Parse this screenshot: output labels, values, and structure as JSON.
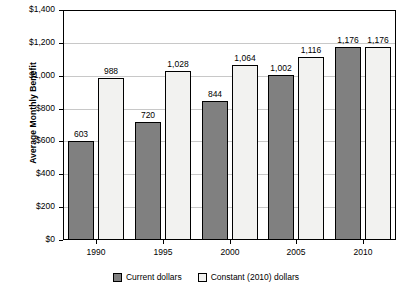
{
  "chart_data": {
    "type": "bar",
    "title": "",
    "xlabel": "",
    "ylabel": "Average Monthly Benefit",
    "categories": [
      "1990",
      "1995",
      "2000",
      "2005",
      "2010"
    ],
    "series": [
      {
        "name": "Current dollars",
        "values": [
          603,
          720,
          844,
          1002,
          1176
        ],
        "labels": [
          "603",
          "720",
          "844",
          "1,002",
          "1,176"
        ],
        "color": "#808080"
      },
      {
        "name": "Constant (2010) dollars",
        "values": [
          988,
          1028,
          1064,
          1116,
          1176
        ],
        "labels": [
          "988",
          "1,028",
          "1,064",
          "1,116",
          "1,176"
        ],
        "color": "#F2F2F0"
      }
    ],
    "ylim": [
      0,
      1400
    ],
    "ytick_values": [
      0,
      200,
      400,
      600,
      800,
      1000,
      1200,
      1400
    ],
    "ytick_labels": [
      "$0",
      "$200",
      "$400",
      "$600",
      "$800",
      "$1,000",
      "$1,200",
      "$1,400"
    ],
    "grid": true,
    "legend_position": "bottom"
  }
}
